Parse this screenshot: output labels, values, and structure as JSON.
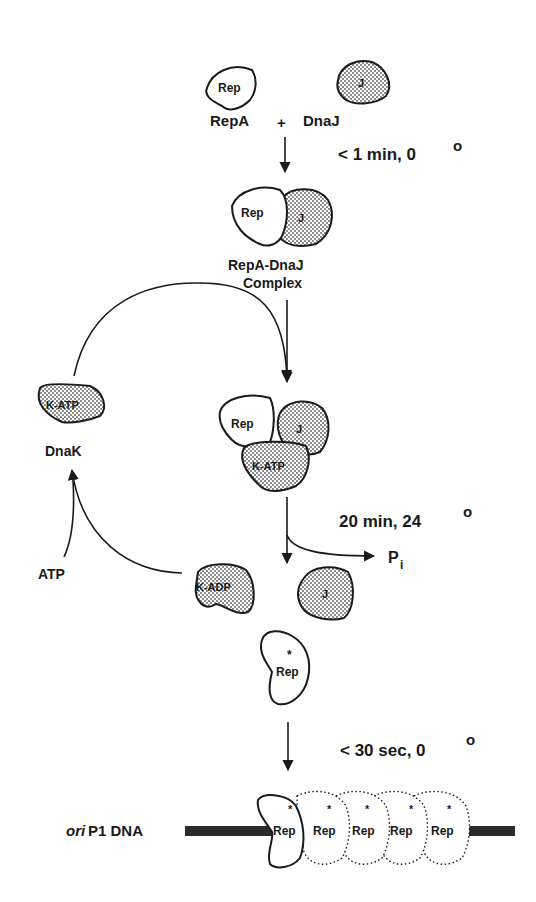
{
  "diagram": {
    "step1": {
      "rep_blob_label": "Rep",
      "j_blob_label": "J",
      "repA_label": "RepA",
      "plus": "+",
      "dnaJ_label": "DnaJ",
      "condition": "< 1 min, 0",
      "degree": "o"
    },
    "step2": {
      "rep_label": "Rep",
      "j_label": "J",
      "complex_line1": "RepA-DnaJ",
      "complex_line2": "Complex"
    },
    "step3": {
      "rep_label": "Rep",
      "j_label": "J",
      "katp_label": "K-ATP",
      "condition": "20 min, 24",
      "degree": "o",
      "pi_label": "P",
      "pi_sub": "i"
    },
    "cycle": {
      "katp_label": "K-ATP",
      "dnak_label": "DnaK",
      "atp_label": "ATP",
      "kadp_label": "K-ADP"
    },
    "step4": {
      "j_label": "J",
      "rep_star_label": "Rep",
      "star": "*",
      "condition": "< 30 sec, 0",
      "degree": "o"
    },
    "dna": {
      "label_italic": "ori",
      "label_rest": " P1 DNA",
      "rep_labels": [
        "Rep",
        "Rep",
        "Rep",
        "Rep",
        "Rep"
      ],
      "star": "*"
    },
    "colors": {
      "ink": "#1a1a1a",
      "stipple": "#9a9a9a",
      "background": "#ffffff"
    }
  }
}
